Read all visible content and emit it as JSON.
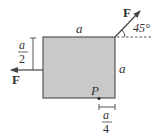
{
  "diagram": {
    "type": "free-body / force diagram",
    "square": {
      "fill": "#c9c9c9",
      "stroke": "#555555"
    },
    "labels": {
      "top_side": "a",
      "right_side": "a",
      "force_top_right": "F",
      "force_left": "F",
      "angle": "45°",
      "point": "P",
      "left_dim_num": "a",
      "left_dim_den": "2",
      "bottom_dim_num": "a",
      "bottom_dim_den": "4"
    },
    "colors": {
      "line": "#444444",
      "text": "#333333",
      "background": "#ffffff"
    }
  }
}
